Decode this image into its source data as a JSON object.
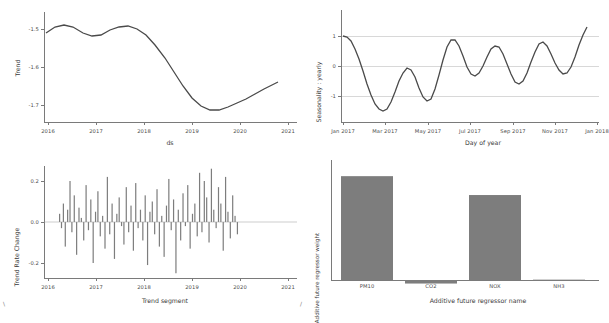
{
  "figure": {
    "background": "#ffffff",
    "line_color": "#4a4a4a",
    "bar_color": "#7d7d7d",
    "corner_marks": {
      "bottom_left": "\\",
      "bottom_mid": "/"
    }
  },
  "chart_data": [
    {
      "id": "trend",
      "type": "line",
      "title": "",
      "xlabel": "ds",
      "ylabel": "Trend",
      "x_ticklabels": [
        "2016",
        "2017",
        "2018",
        "2019",
        "2020",
        "2021"
      ],
      "y_ticklabels": [
        "-1.5",
        "-1.6",
        "-1.7"
      ],
      "ylim": [
        -1.745,
        -1.455
      ],
      "xlim": [
        2015.75,
        2021.1
      ],
      "grid": false,
      "x": [
        2015.8,
        2016.0,
        2016.2,
        2016.4,
        2016.6,
        2016.8,
        2017.0,
        2017.2,
        2017.4,
        2017.6,
        2017.8,
        2018.0,
        2018.2,
        2018.4,
        2018.6,
        2018.8,
        2019.0,
        2019.2,
        2019.4,
        2019.6,
        2019.8,
        2020.0,
        2020.2,
        2020.4,
        2020.6,
        2020.9
      ],
      "y": [
        -1.512,
        -1.5,
        -1.496,
        -1.501,
        -1.512,
        -1.52,
        -1.516,
        -1.505,
        -1.497,
        -1.496,
        -1.503,
        -1.519,
        -1.545,
        -1.58,
        -1.618,
        -1.655,
        -1.686,
        -1.707,
        -1.717,
        -1.716,
        -1.709,
        -1.699,
        -1.688,
        -1.676,
        -1.663,
        -1.645
      ]
    },
    {
      "id": "yearly-seasonality",
      "type": "line",
      "title": "",
      "xlabel": "Day of year",
      "ylabel": "Seasonality : yearly",
      "x_ticklabels": [
        "Jan 2017",
        "Mar 2017",
        "May 2017",
        "Jul 2017",
        "Sep 2017",
        "Nov 2017",
        "Jan 2018"
      ],
      "y_ticklabels": [
        "1",
        "0",
        "-1"
      ],
      "ylim": [
        -1.6,
        1.75
      ],
      "grid": true,
      "x": [
        0,
        6,
        12,
        18,
        24,
        30,
        36,
        42,
        48,
        54,
        60,
        66,
        72,
        78,
        84,
        90,
        96,
        102,
        108,
        114,
        120,
        126,
        132,
        138,
        144,
        150,
        156,
        162,
        168,
        174,
        180,
        186,
        192,
        198,
        204,
        210,
        216,
        222,
        228,
        234,
        240,
        246,
        252,
        258,
        264,
        270,
        276,
        282,
        288,
        294,
        300,
        306,
        312,
        318,
        324,
        330,
        336,
        342,
        348,
        354,
        360,
        366
      ],
      "y": [
        1.0,
        0.95,
        0.8,
        0.55,
        0.22,
        -0.18,
        -0.6,
        -0.98,
        -1.28,
        -1.45,
        -1.5,
        -1.42,
        -1.2,
        -0.88,
        -0.52,
        -0.22,
        -0.06,
        -0.12,
        -0.38,
        -0.72,
        -1.02,
        -1.18,
        -1.1,
        -0.78,
        -0.3,
        0.2,
        0.62,
        0.85,
        0.85,
        0.65,
        0.32,
        -0.02,
        -0.26,
        -0.34,
        -0.24,
        0.0,
        0.3,
        0.56,
        0.68,
        0.62,
        0.38,
        0.05,
        -0.28,
        -0.52,
        -0.6,
        -0.5,
        -0.24,
        0.12,
        0.48,
        0.72,
        0.78,
        0.66,
        0.4,
        0.1,
        -0.14,
        -0.26,
        -0.22,
        -0.02,
        0.3,
        0.68,
        1.02,
        1.28
      ]
    },
    {
      "id": "trend-rate-change",
      "type": "bar",
      "title": "",
      "xlabel": "Trend segment",
      "ylabel": "Trend Rate Change",
      "x_ticklabels": [
        "2016",
        "2017",
        "2018",
        "2019",
        "2020",
        "2021"
      ],
      "y_ticklabels": [
        "0.2",
        "0.0",
        "-0.2"
      ],
      "ylim": [
        -0.3,
        0.3
      ],
      "grid": false,
      "categories": [
        2016.08,
        2016.12,
        2016.16,
        2016.2,
        2016.25,
        2016.3,
        2016.34,
        2016.39,
        2016.44,
        2016.49,
        2016.54,
        2016.59,
        2016.64,
        2016.69,
        2016.74,
        2016.79,
        2016.84,
        2016.89,
        2016.94,
        2016.99,
        2017.04,
        2017.09,
        2017.14,
        2017.19,
        2017.24,
        2017.29,
        2017.34,
        2017.39,
        2017.44,
        2017.49,
        2017.54,
        2017.59,
        2017.64,
        2017.69,
        2017.74,
        2017.79,
        2017.84,
        2017.89,
        2017.94,
        2017.99,
        2018.04,
        2018.09,
        2018.14,
        2018.19,
        2018.24,
        2018.29,
        2018.34,
        2018.39,
        2018.44,
        2018.49,
        2018.54,
        2018.59,
        2018.64,
        2018.69,
        2018.74,
        2018.79,
        2018.84,
        2018.89,
        2018.94,
        2018.99,
        2019.04,
        2019.09,
        2019.14,
        2019.19,
        2019.24,
        2019.29,
        2019.34,
        2019.39,
        2019.44,
        2019.49,
        2019.54,
        2019.59,
        2019.64,
        2019.69,
        2019.74,
        2019.79,
        2019.84
      ],
      "values": [
        0.04,
        -0.03,
        0.09,
        -0.12,
        0.06,
        0.2,
        -0.05,
        0.13,
        -0.16,
        0.07,
        0.02,
        -0.09,
        0.18,
        -0.04,
        0.11,
        -0.2,
        0.05,
        0.15,
        -0.07,
        0.03,
        -0.13,
        0.22,
        -0.06,
        0.09,
        -0.18,
        0.04,
        0.12,
        -0.02,
        -0.11,
        0.17,
        -0.05,
        0.08,
        -0.14,
        0.19,
        -0.03,
        0.06,
        -0.09,
        0.13,
        -0.21,
        0.05,
        0.1,
        -0.06,
        0.16,
        -0.12,
        0.03,
        -0.17,
        0.08,
        0.21,
        -0.04,
        0.11,
        -0.25,
        0.06,
        -0.09,
        0.14,
        -0.02,
        0.18,
        -0.13,
        0.04,
        0.09,
        -0.07,
        0.24,
        -0.05,
        0.2,
        0.12,
        -0.1,
        0.26,
        0.06,
        -0.03,
        0.17,
        0.09,
        -0.14,
        0.22,
        0.05,
        -0.08,
        0.13,
        0.03,
        -0.06
      ]
    },
    {
      "id": "additive-future-regressor-weight",
      "type": "bar",
      "title": "",
      "xlabel": "Additive future regressor name",
      "ylabel": "Additive future regressor weight",
      "categories": [
        "PM10",
        "CO2",
        "NOX",
        "NH3"
      ],
      "values": [
        0.88,
        -0.03,
        0.72,
        0.003
      ],
      "y_ticklabels": [],
      "ylim": [
        -0.08,
        1.0
      ],
      "grid": false
    }
  ]
}
